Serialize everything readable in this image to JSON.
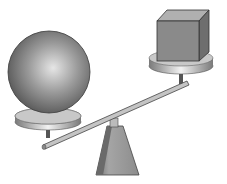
{
  "scene": {
    "description": "Balance scale (seesaw) with a large sphere on the lower left plate and a small cube on the raised right plate",
    "objects": [
      {
        "name": "sphere",
        "position": "left",
        "state": "lower"
      },
      {
        "name": "cube",
        "position": "right",
        "state": "raised"
      },
      {
        "name": "fulcrum",
        "shape": "trapezoid pyramid"
      }
    ],
    "colors": {
      "background": "#ffffff",
      "sphere_light": "#d8d8d8",
      "sphere_dark": "#555555",
      "cube_front": "#8a8a8a",
      "cube_top": "#b0b0b0",
      "cube_side": "#6e6e6e",
      "plate": "#cfcfcf",
      "beam": "#bdbdbd",
      "fulcrum": "#9a9a9a"
    }
  }
}
